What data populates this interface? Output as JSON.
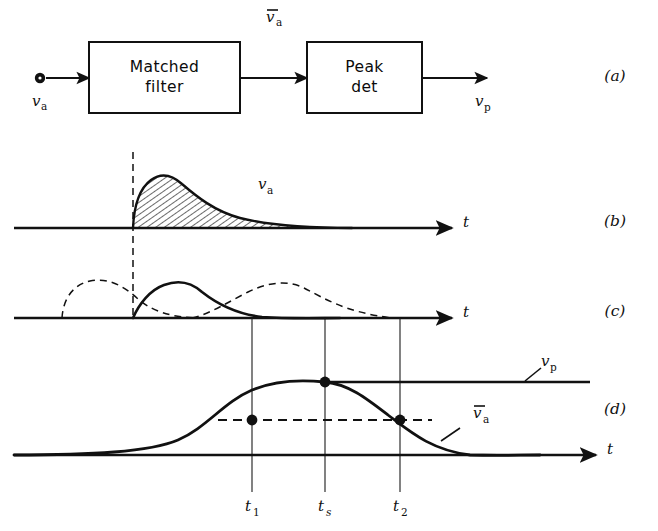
{
  "figure": {
    "title_semantic": "matched-filter peak-detector block diagram and waveform timing",
    "axis_label_t": "t",
    "panels": [
      {
        "id": "a",
        "label": "(a)"
      },
      {
        "id": "b",
        "label": "(b)"
      },
      {
        "id": "c",
        "label": "(c)"
      },
      {
        "id": "d",
        "label": "(d)"
      }
    ]
  },
  "block_diagram": {
    "input_signal": {
      "base": "v",
      "sub": "a",
      "overbar": false
    },
    "intermediate_signal": {
      "base": "v",
      "sub": "a",
      "overbar": true
    },
    "output_signal": {
      "base": "v",
      "sub": "p",
      "overbar": false
    },
    "blocks": [
      {
        "name": "matched-filter",
        "line1": "Matched",
        "line2": "filter"
      },
      {
        "name": "peak-detector",
        "line1": "Peak",
        "line2": "det"
      }
    ]
  },
  "waveforms": {
    "panel_b": {
      "curve_label": {
        "base": "v",
        "sub": "a",
        "overbar": false
      },
      "fill": "hatched",
      "onset_marker": "dashed-vertical"
    },
    "panel_c": {
      "solid_curve": "matched-filter output for centre pulse",
      "dashed_curves": 2,
      "onset_marker": "dashed-vertical",
      "drop_lines": 3
    },
    "panel_d": {
      "curve_label": {
        "base": "v",
        "sub": "a",
        "overbar": true
      },
      "threshold_label": {
        "base": "v",
        "sub": "p",
        "overbar": false
      },
      "markers": [
        {
          "name": "t1",
          "base": "t",
          "sub": "1"
        },
        {
          "name": "ts",
          "base": "t",
          "sub": "s"
        },
        {
          "name": "t2",
          "base": "t",
          "sub": "2"
        }
      ],
      "dot_count": 3,
      "threshold_line": "dashed-horizontal"
    }
  },
  "colors": {
    "ink": "#111111",
    "paper": "#ffffff",
    "thin_rule": "#3a3a3a"
  }
}
